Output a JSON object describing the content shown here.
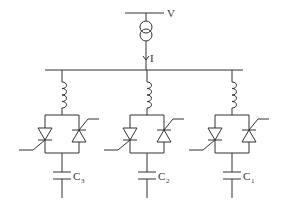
{
  "diagram": {
    "source_label": "V",
    "current_label": "I",
    "branches": [
      {
        "id": "branch-3",
        "x": 62,
        "cap_label": "C",
        "cap_sub": "3"
      },
      {
        "id": "branch-2",
        "x": 147,
        "cap_label": "C",
        "cap_sub": "2"
      },
      {
        "id": "branch-1",
        "x": 232,
        "cap_label": "C",
        "cap_sub": "1"
      }
    ]
  }
}
